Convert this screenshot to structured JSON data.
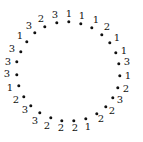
{
  "diagram": {
    "type": "circular-dot-sequence",
    "dot_color": "#111111",
    "background": "#ffffff",
    "points": [
      {
        "dx": 69,
        "dy": 22,
        "lx": 69,
        "ly": 14,
        "label": "1"
      },
      {
        "dx": 81,
        "dy": 24,
        "lx": 82,
        "ly": 16,
        "label": "1"
      },
      {
        "dx": 92,
        "dy": 28,
        "lx": 96,
        "ly": 20,
        "label": "1"
      },
      {
        "dx": 102,
        "dy": 35,
        "lx": 107,
        "ly": 27,
        "label": "2"
      },
      {
        "dx": 110,
        "dy": 43,
        "lx": 117,
        "ly": 38,
        "label": "1"
      },
      {
        "dx": 116,
        "dy": 53,
        "lx": 124,
        "ly": 51,
        "label": "1"
      },
      {
        "dx": 119,
        "dy": 64,
        "lx": 127,
        "ly": 62,
        "label": "3"
      },
      {
        "dx": 120,
        "dy": 76,
        "lx": 128,
        "ly": 76,
        "label": "1"
      },
      {
        "dx": 118,
        "dy": 88,
        "lx": 126,
        "ly": 89,
        "label": "2"
      },
      {
        "dx": 113,
        "dy": 98,
        "lx": 120,
        "ly": 100,
        "label": "3"
      },
      {
        "dx": 106,
        "dy": 107,
        "lx": 112,
        "ly": 111,
        "label": "2"
      },
      {
        "dx": 97,
        "dy": 114,
        "lx": 101,
        "ly": 119,
        "label": "2"
      },
      {
        "dx": 86,
        "dy": 119,
        "lx": 88,
        "ly": 127,
        "label": "1"
      },
      {
        "dx": 74,
        "dy": 121,
        "lx": 75,
        "ly": 128,
        "label": "2"
      },
      {
        "dx": 62,
        "dy": 121,
        "lx": 61,
        "ly": 128,
        "label": "2"
      },
      {
        "dx": 51,
        "dy": 118,
        "lx": 47,
        "ly": 126,
        "label": "2"
      },
      {
        "dx": 40,
        "dy": 113,
        "lx": 35,
        "ly": 121,
        "label": "3"
      },
      {
        "dx": 31,
        "dy": 106,
        "lx": 25,
        "ly": 110,
        "label": "3"
      },
      {
        "dx": 24,
        "dy": 97,
        "lx": 16,
        "ly": 100,
        "label": "2"
      },
      {
        "dx": 19,
        "dy": 86,
        "lx": 10,
        "ly": 88,
        "label": "1"
      },
      {
        "dx": 17,
        "dy": 75,
        "lx": 7,
        "ly": 74,
        "label": "3"
      },
      {
        "dx": 17,
        "dy": 62,
        "lx": 8,
        "ly": 62,
        "label": "3"
      },
      {
        "dx": 21,
        "dy": 52,
        "lx": 12,
        "ly": 49,
        "label": "3"
      },
      {
        "dx": 27,
        "dy": 42,
        "lx": 20,
        "ly": 36,
        "label": "1"
      },
      {
        "dx": 35,
        "dy": 33,
        "lx": 29,
        "ly": 26,
        "label": "3"
      },
      {
        "dx": 45,
        "dy": 27,
        "lx": 41,
        "ly": 19,
        "label": "2"
      },
      {
        "dx": 57,
        "dy": 23,
        "lx": 55,
        "ly": 15,
        "label": "3"
      }
    ]
  }
}
